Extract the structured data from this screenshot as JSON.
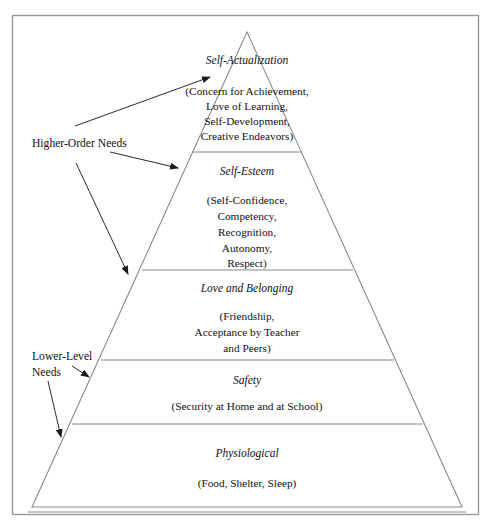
{
  "diagram": {
    "type": "pyramid",
    "background_color": "#ffffff",
    "line_color": "#8a8a8a",
    "text_color": "#111111",
    "annotation_color": "#2b2b2b",
    "tiers": [
      {
        "index": 1,
        "position": "top",
        "title": "Self-Actualization",
        "detail_lines": [
          "(Concern for Achievement,",
          "Love of Learning,",
          "Self-Development,",
          "Creative Endeavors)"
        ]
      },
      {
        "index": 2,
        "position": "second",
        "title": "Self-Esteem",
        "detail_lines": [
          "(Self-Confidence,",
          "Competency,",
          "Recognition,",
          "Autonomy,",
          "Respect)"
        ]
      },
      {
        "index": 3,
        "position": "third",
        "title": "Love and Belonging",
        "detail_lines": [
          "(Friendship,",
          "Acceptance by Teacher",
          "and Peers)"
        ]
      },
      {
        "index": 4,
        "position": "fourth",
        "title": "Safety",
        "detail_lines": [
          "(Security at Home and at School)"
        ]
      },
      {
        "index": 5,
        "position": "bottom",
        "title": "Physiological",
        "detail_lines": [
          "(Food, Shelter, Sleep)"
        ]
      }
    ],
    "side_labels": {
      "higher_order": {
        "text": "Higher-Order Needs",
        "arrow_count": 3,
        "points_to": [
          "Self-Actualization",
          "Self-Esteem",
          "Love and Belonging"
        ]
      },
      "lower_level": {
        "line_1": "Lower-Level",
        "line_2": "Needs",
        "arrow_count": 2,
        "points_to": [
          "Safety",
          "Physiological"
        ]
      }
    }
  }
}
